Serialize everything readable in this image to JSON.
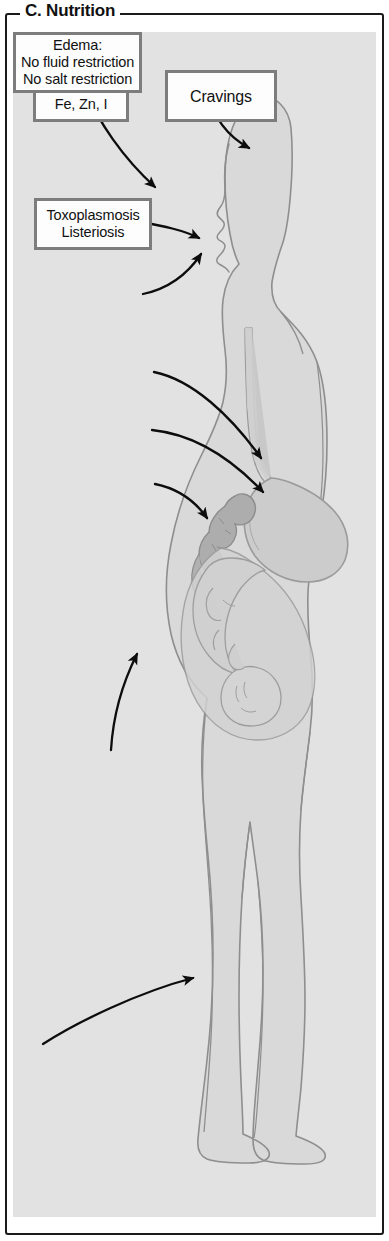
{
  "panel": {
    "title": "C. Nutrition",
    "frame_color": "#1a1a1a",
    "plate_background": "#e2e2e2",
    "label_border_color": "#7d7d7d",
    "label_fill_color": "#fdfdfd",
    "text_color": "#111111"
  },
  "figure": {
    "body_fill": "#d4d4d4",
    "organ_fill": "#c4c4c4",
    "colon_fill": "#a9a9a9",
    "outline_color": "#8e8e8e"
  },
  "labels": [
    {
      "id": "calories",
      "lines": [
        "Calories?",
        "Fe, Zn, I"
      ],
      "target": "mouth"
    },
    {
      "id": "cravings",
      "lines": [
        "Cravings"
      ],
      "target": "head"
    },
    {
      "id": "toxoplasmosis",
      "lines": [
        "Toxoplasmosis",
        "Listeriosis"
      ],
      "target": "mouth"
    },
    {
      "id": "vitamins",
      "lines": [
        "Vitamins:",
        "e.g., folic acid"
      ],
      "target": "mouth"
    },
    {
      "id": "heartburn",
      "lines": [
        "Heartburn"
      ],
      "target": "esophagus"
    },
    {
      "id": "muscle_tone",
      "lines": [
        "Reduced",
        "muscle tone"
      ],
      "target": "stomach"
    },
    {
      "id": "constipation",
      "lines": [
        "Constipation"
      ],
      "target": "colon"
    },
    {
      "id": "weight",
      "lines": [
        "Initial weight",
        "Weight gain"
      ],
      "target": "abdomen"
    },
    {
      "id": "edema",
      "lines": [
        "Edema:",
        "No fluid restriction",
        "No salt restriction"
      ],
      "target": "lower_leg"
    }
  ]
}
